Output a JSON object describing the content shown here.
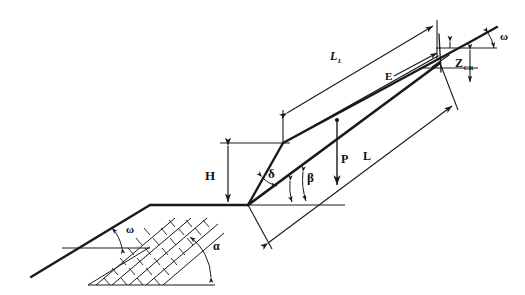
{
  "figure": {
    "background_color": "#ffffff",
    "line_color": "#1a1a1a",
    "text_color": "#111111"
  },
  "labels": {
    "omega_upper": "ω",
    "omega_lower": "ω",
    "alpha": "α",
    "beta": "β",
    "delta": "δ",
    "height": "H",
    "force_p": "P",
    "length_l": "L",
    "length_ll_base": "L",
    "length_ll_sub": "L",
    "thrust_e": "E",
    "zcr_base": "Z",
    "zcr_sub": "CR"
  },
  "annotations": [
    {
      "name": "slope-angle-upper",
      "symbol": "ω",
      "meaning": "upper slope inclination"
    },
    {
      "name": "slope-angle-lower",
      "symbol": "ω",
      "meaning": "ground surface inclination"
    },
    {
      "name": "bedding-dip-angle",
      "symbol": "α",
      "meaning": "dip angle of bedding planes"
    },
    {
      "name": "failure-plane-angle",
      "symbol": "β",
      "meaning": "inclination of failure plane"
    },
    {
      "name": "face-angle",
      "symbol": "δ",
      "meaning": "angle of slope face at toe"
    },
    {
      "name": "slope-height",
      "symbol": "H",
      "meaning": "vertical slope height"
    },
    {
      "name": "weight-force",
      "symbol": "P",
      "meaning": "weight of sliding block"
    },
    {
      "name": "slide-length",
      "symbol": "L",
      "meaning": "length of failure plane"
    },
    {
      "name": "upper-length",
      "symbol": "L_L",
      "meaning": "length of upper slope surface"
    },
    {
      "name": "thrust-force",
      "symbol": "E",
      "meaning": "thrust force"
    },
    {
      "name": "tension-crack-depth",
      "symbol": "Z_CR",
      "meaning": "critical tension crack depth"
    }
  ]
}
